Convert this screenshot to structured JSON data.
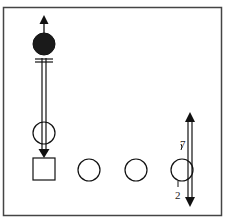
{
  "diagram": {
    "type": "play-diagram",
    "frame": {
      "x": 3,
      "y": 7,
      "width": 219,
      "height": 209,
      "stroke": "#444444"
    },
    "colors": {
      "line": "#111111",
      "filled_player": "#1a1a1a",
      "background": "#ffffff"
    },
    "players": [
      {
        "id": "filled-player",
        "shape": "circle",
        "filled": true,
        "cx": 44,
        "cy": 44,
        "r": 11
      },
      {
        "id": "open-player-mid",
        "shape": "circle",
        "filled": false,
        "cx": 44,
        "cy": 133,
        "r": 11
      },
      {
        "id": "square-player",
        "shape": "square",
        "filled": false,
        "x": 33,
        "y": 158,
        "size": 22
      },
      {
        "id": "open-player-1",
        "shape": "circle",
        "filled": false,
        "cx": 89,
        "cy": 170,
        "r": 11
      },
      {
        "id": "open-player-2",
        "shape": "circle",
        "filled": false,
        "cx": 136,
        "cy": 170,
        "r": 11
      },
      {
        "id": "open-player-3",
        "shape": "circle",
        "filled": false,
        "cx": 182,
        "cy": 170,
        "r": 11
      }
    ],
    "labels": [
      {
        "id": "label-7",
        "text": "7",
        "x": 180,
        "y": 139
      },
      {
        "id": "label-2",
        "text": "2",
        "x": 175,
        "y": 190
      }
    ]
  }
}
